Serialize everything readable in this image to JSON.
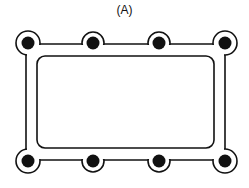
{
  "figure": {
    "label": "(A)",
    "bolt_holes_count": 8,
    "colors": {
      "line": "#111111",
      "background": "#ffffff"
    }
  }
}
